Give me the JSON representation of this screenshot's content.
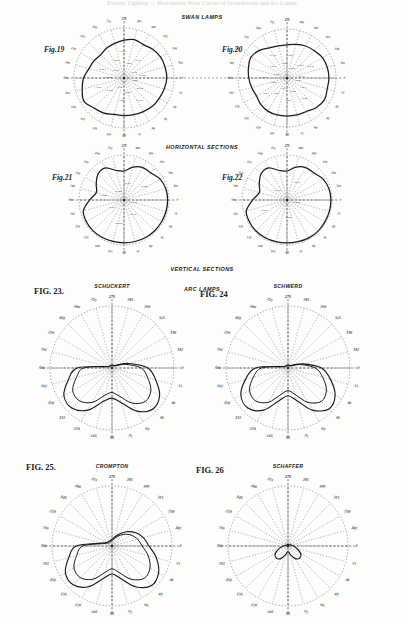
{
  "page": {
    "background": "#fdfdfb",
    "ink": "#1a1a1a",
    "faint_header": "Electric Lighting  —  Photometric Polar Curves of Incandescent and Arc Lamps"
  },
  "sections": [
    {
      "id": "swan-lamps",
      "title": "SWAN LAMPS"
    },
    {
      "id": "horizontal",
      "title": "HORIZONTAL SECTIONS"
    },
    {
      "id": "vertical",
      "title": "VERTICAL SECTIONS"
    },
    {
      "id": "arc-lamps",
      "title": "ARC LAMPS"
    }
  ],
  "figures": [
    {
      "id": "fig19",
      "label": "Fig.19",
      "maker": "",
      "kind": "horizontal-section",
      "center": [
        124,
        78
      ],
      "radius": 50,
      "style": "incandescent",
      "degree_labels": [
        "0",
        "15",
        "30",
        "45",
        "60",
        "75",
        "90",
        "105",
        "120",
        "135",
        "150",
        "165",
        "180",
        "195",
        "210",
        "225",
        "240",
        "255",
        "270",
        "285",
        "300",
        "315",
        "330",
        "345"
      ],
      "values": [
        "1.000",
        "0.989",
        "0.985",
        "0.986",
        "1.025",
        "1.018",
        "0.922",
        "1.023",
        "0.944",
        "0.967",
        "0.961",
        "1.025",
        "1.101",
        "1.050",
        "0.997",
        "1.014",
        "0.988"
      ]
    },
    {
      "id": "fig20",
      "label": "Fig.20",
      "maker": "",
      "kind": "horizontal-section",
      "center": [
        287,
        78
      ],
      "radius": 49,
      "style": "incandescent",
      "degree_labels": [
        "0",
        "15",
        "30",
        "45",
        "60",
        "75",
        "90",
        "105",
        "120",
        "135",
        "150",
        "165",
        "180",
        "195",
        "210",
        "225",
        "240",
        "255",
        "270",
        "285",
        "300",
        "315",
        "330",
        "345"
      ],
      "values": [
        "1.054",
        "1.073",
        "1.050",
        "1.000",
        "1.009",
        "1.014",
        "1.003",
        "1.001",
        "1.004",
        "0.981",
        "0.965",
        "1.003",
        "0.989",
        "1.004",
        "1.026",
        "1.050",
        "0.958",
        "0.936",
        "0.935"
      ]
    },
    {
      "id": "fig21",
      "label": "Fig.21",
      "maker": "",
      "kind": "vertical-section",
      "center": [
        124,
        200
      ],
      "radius": 45,
      "style": "incandescent",
      "degree_labels": [
        "0",
        "15",
        "30",
        "45",
        "60",
        "75",
        "90",
        "105",
        "120",
        "135",
        "150",
        "165",
        "180",
        "195",
        "210",
        "225",
        "240",
        "255",
        "270",
        "285",
        "300",
        "315",
        "330",
        "345"
      ],
      "values": [
        "0.970",
        "0.935",
        "0.960",
        "0.967",
        "0.944",
        "0.980",
        "0.943",
        "0.980"
      ]
    },
    {
      "id": "fig22",
      "label": "Fig.22",
      "maker": "",
      "kind": "vertical-section",
      "center": [
        287,
        200
      ],
      "radius": 45,
      "style": "incandescent",
      "degree_labels": [
        "0",
        "15",
        "30",
        "45",
        "60",
        "75",
        "90",
        "105",
        "120",
        "135",
        "150",
        "165",
        "180",
        "195",
        "210",
        "225",
        "240",
        "255",
        "270",
        "285",
        "300",
        "315",
        "330",
        "345"
      ],
      "values": [
        "0.945",
        "0.985",
        "0.997",
        "0.955",
        "0.993"
      ]
    },
    {
      "id": "fig23",
      "label": "FIG. 23.",
      "maker": "SCHUCKERT",
      "kind": "arc-lamp",
      "center": [
        112,
        368
      ],
      "radius": 62,
      "style": "arc-broad",
      "degree_labels": [
        "0",
        "15",
        "30",
        "45",
        "60",
        "75",
        "90",
        "105",
        "120",
        "135",
        "150",
        "165",
        "180",
        "195",
        "210",
        "225",
        "240",
        "255",
        "270",
        "285",
        "300",
        "315",
        "330",
        "345"
      ],
      "values": []
    },
    {
      "id": "fig24",
      "label": "FIG. 24",
      "maker": "SCHWERD",
      "kind": "arc-lamp",
      "center": [
        288,
        368
      ],
      "radius": 62,
      "style": "arc-broad",
      "degree_labels": [
        "0",
        "15",
        "30",
        "45",
        "60",
        "75",
        "90",
        "105",
        "120",
        "135",
        "150",
        "165",
        "180",
        "195",
        "210",
        "225",
        "240",
        "255",
        "270",
        "285",
        "300",
        "315",
        "330",
        "345"
      ],
      "values": []
    },
    {
      "id": "fig25",
      "label": "FIG. 25.",
      "maker": "CROMPTON",
      "kind": "arc-lamp",
      "center": [
        112,
        546
      ],
      "radius": 60,
      "style": "arc-broad",
      "degree_labels": [
        "0",
        "15",
        "30",
        "45",
        "60",
        "75",
        "90",
        "105",
        "120",
        "135",
        "150",
        "165",
        "180",
        "195",
        "210",
        "225",
        "240",
        "255",
        "270",
        "285",
        "300",
        "315",
        "330",
        "345"
      ],
      "values": []
    },
    {
      "id": "fig26",
      "label": "FIG. 26",
      "maker": "SCHAFFER",
      "kind": "arc-lamp",
      "center": [
        288,
        546
      ],
      "radius": 60,
      "style": "arc-narrow",
      "degree_labels": [
        "0",
        "15",
        "30",
        "45",
        "60",
        "75",
        "90",
        "105",
        "120",
        "135",
        "150",
        "165",
        "180",
        "195",
        "210",
        "225",
        "240",
        "255",
        "270",
        "285",
        "300",
        "315",
        "330",
        "345"
      ],
      "values": []
    }
  ],
  "chart_data": {
    "type": "line",
    "subtitle": "Horizontal sections (Figs. 19, 20), Vertical sections (Figs. 21, 22), Arc lamps (Figs. 23-26)",
    "xlabel": "Angle (degrees)",
    "ylabel": "Relative candle power",
    "grid": true,
    "legend": "none",
    "angle_ticks": [
      0,
      15,
      30,
      45,
      60,
      75,
      90,
      105,
      120,
      135,
      150,
      165,
      180,
      195,
      210,
      225,
      240,
      255,
      270,
      285,
      300,
      315,
      330,
      345
    ],
    "charts": [
      {
        "id": "fig19",
        "name": "Fig.19 — Swan lamp, horizontal section",
        "type": "line",
        "polar": true,
        "categories": [
          0,
          15,
          30,
          45,
          60,
          75,
          90,
          105,
          120,
          135,
          150,
          165,
          180,
          195,
          210,
          225,
          240,
          255,
          270,
          285,
          300,
          315,
          330,
          345
        ],
        "values": [
          1.054,
          1.04,
          1.025,
          1.018,
          1.0,
          0.989,
          0.985,
          0.986,
          1.023,
          1.05,
          1.101,
          1.06,
          1.023,
          0.967,
          0.944,
          0.922,
          0.944,
          0.961,
          0.988,
          1.014,
          0.997,
          1.025,
          1.045,
          1.05
        ],
        "rlim": [
          0.85,
          1.15
        ]
      },
      {
        "id": "fig20",
        "name": "Fig.20 — Swan lamp, horizontal section",
        "type": "line",
        "polar": true,
        "categories": [
          0,
          15,
          30,
          45,
          60,
          75,
          90,
          105,
          120,
          135,
          150,
          165,
          180,
          195,
          210,
          225,
          240,
          255,
          270,
          285,
          300,
          315,
          330,
          345
        ],
        "values": [
          1.054,
          1.05,
          1.073,
          1.05,
          1.009,
          1.003,
          1.001,
          1.004,
          1.004,
          0.989,
          0.965,
          0.981,
          1.003,
          1.026,
          1.05,
          1.014,
          0.958,
          0.936,
          0.935,
          0.958,
          0.986,
          1.009,
          1.04,
          1.05
        ],
        "rlim": [
          0.85,
          1.15
        ]
      },
      {
        "id": "fig21",
        "name": "Fig.21 — Swan lamp, vertical section",
        "type": "line",
        "polar": true,
        "categories": [
          0,
          15,
          30,
          45,
          60,
          75,
          90,
          105,
          120,
          135,
          150,
          165,
          180,
          195,
          210,
          225,
          240,
          255,
          270,
          285,
          300,
          315,
          330,
          345
        ],
        "values": [
          0.98,
          0.975,
          0.97,
          0.967,
          0.96,
          0.944,
          0.935,
          0.943,
          0.96,
          0.98,
          0.97,
          0.9,
          0.5,
          0.2,
          0.38,
          0.62,
          0.64,
          0.3,
          0.22,
          0.48,
          0.66,
          0.7,
          0.88,
          0.96
        ],
        "rlim": [
          0,
          1.05
        ]
      },
      {
        "id": "fig22",
        "name": "Fig.22 — Swan lamp, vertical section",
        "type": "line",
        "polar": true,
        "categories": [
          0,
          15,
          30,
          45,
          60,
          75,
          90,
          105,
          120,
          135,
          150,
          165,
          180,
          195,
          210,
          225,
          240,
          255,
          270,
          285,
          300,
          315,
          330,
          345
        ],
        "values": [
          0.993,
          0.99,
          0.985,
          0.997,
          0.985,
          0.955,
          0.945,
          0.955,
          0.975,
          0.99,
          0.97,
          0.9,
          0.5,
          0.2,
          0.38,
          0.62,
          0.64,
          0.3,
          0.22,
          0.48,
          0.66,
          0.7,
          0.88,
          0.97
        ],
        "rlim": [
          0,
          1.05
        ]
      },
      {
        "id": "fig23",
        "name": "Fig.23 — Schuckert arc lamp",
        "type": "line",
        "polar": true,
        "categories": [
          0,
          15,
          30,
          45,
          60,
          75,
          90,
          105,
          120,
          135,
          150,
          165,
          180,
          195,
          210,
          225,
          240,
          255,
          270,
          285,
          300,
          315,
          330,
          345
        ],
        "values": [
          0.62,
          0.78,
          0.95,
          1.0,
          0.86,
          0.62,
          0.52,
          0.6,
          0.84,
          0.98,
          0.96,
          0.78,
          0.6,
          0.1,
          0.06,
          0.05,
          0.05,
          0.05,
          0.05,
          0.05,
          0.05,
          0.06,
          0.1,
          0.3
        ],
        "rlim": [
          0,
          1.05
        ]
      },
      {
        "id": "fig24",
        "name": "Fig.24 — Schwerd arc lamp",
        "type": "line",
        "polar": true,
        "categories": [
          0,
          15,
          30,
          45,
          60,
          75,
          90,
          105,
          120,
          135,
          150,
          165,
          180,
          195,
          210,
          225,
          240,
          255,
          270,
          285,
          300,
          315,
          330,
          345
        ],
        "values": [
          0.58,
          0.76,
          0.94,
          1.0,
          0.84,
          0.58,
          0.48,
          0.58,
          0.84,
          0.98,
          0.94,
          0.76,
          0.56,
          0.1,
          0.06,
          0.05,
          0.05,
          0.05,
          0.05,
          0.05,
          0.05,
          0.06,
          0.1,
          0.28
        ],
        "rlim": [
          0,
          1.05
        ]
      },
      {
        "id": "fig25",
        "name": "Fig.25 — Crompton arc lamp",
        "type": "line",
        "polar": true,
        "categories": [
          0,
          15,
          30,
          45,
          60,
          75,
          90,
          105,
          120,
          135,
          150,
          165,
          180,
          195,
          210,
          225,
          240,
          255,
          270,
          285,
          300,
          315,
          330,
          345
        ],
        "values": [
          0.66,
          0.82,
          0.96,
          1.0,
          0.84,
          0.6,
          0.5,
          0.6,
          0.84,
          0.98,
          0.96,
          0.8,
          0.64,
          0.2,
          0.12,
          0.1,
          0.1,
          0.1,
          0.12,
          0.16,
          0.24,
          0.36,
          0.48,
          0.58
        ],
        "rlim": [
          0,
          1.05
        ]
      },
      {
        "id": "fig26",
        "name": "Fig.26 — Schaffer arc lamp",
        "type": "line",
        "polar": true,
        "categories": [
          0,
          15,
          30,
          45,
          60,
          75,
          90,
          105,
          120,
          135,
          150,
          165,
          180,
          195,
          210,
          225,
          240,
          255,
          270,
          285,
          300,
          315,
          330,
          345
        ],
        "values": [
          0.1,
          0.16,
          0.26,
          0.3,
          0.26,
          0.16,
          0.1,
          0.16,
          0.26,
          0.3,
          0.26,
          0.16,
          0.08,
          0.04,
          0.03,
          0.03,
          0.03,
          0.03,
          0.03,
          0.03,
          0.03,
          0.03,
          0.04,
          0.06
        ],
        "rlim": [
          0,
          1.05
        ]
      }
    ]
  }
}
